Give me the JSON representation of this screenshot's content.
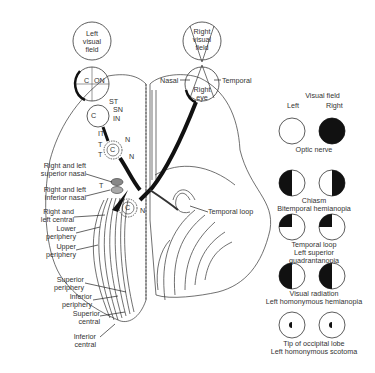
{
  "diagram": {
    "left_visual_field": [
      "Left",
      "visual",
      "field"
    ],
    "right_visual_field": [
      "Right",
      "visual",
      "field"
    ],
    "right_eye": [
      "Right",
      "eye"
    ],
    "nasal": "Nasal",
    "temporal": "Temporal",
    "retina_labels": {
      "c": "C",
      "on": "ON"
    },
    "optic_nerve_labels": {
      "st": "ST",
      "sn": "SN",
      "in": "IN",
      "c": "C",
      "it": "IT"
    },
    "chiasm_labels": {
      "t1": "T",
      "t2": "T",
      "n1": "N",
      "n2": "N",
      "c": "C"
    },
    "lgn_labels": {
      "t": "T",
      "c": "C",
      "n": "N",
      "t2": "T"
    },
    "left_labels": {
      "superior_nasal": [
        "Right and left",
        "superior nasal"
      ],
      "inferior_nasal": [
        "Right and left",
        "inferior nasal"
      ],
      "central": [
        "Right and",
        "left central"
      ],
      "lower_periphery": [
        "Lower",
        "periphery"
      ],
      "upper_periphery": [
        "Upper",
        "periphery"
      ],
      "superior_periphery": [
        "Superior",
        "periphery"
      ],
      "inferior_periphery": [
        "Inferior",
        "periphery"
      ],
      "superior_central": [
        "Superior",
        "central"
      ],
      "inferior_central": [
        "Inferior",
        "central"
      ]
    },
    "temporal_loop": "Temporal loop"
  },
  "legend": {
    "header": "Visual field",
    "left": "Left",
    "right": "Right",
    "rows": [
      {
        "caption": [
          "Optic nerve"
        ],
        "left_defect": "none",
        "right_defect": "full"
      },
      {
        "caption": [
          "Chiasm",
          "Bitemporal hemianopia"
        ],
        "left_defect": "left-half",
        "right_defect": "right-half"
      },
      {
        "caption": [
          "Temporal loop",
          "Left superior",
          "quadrantanopia"
        ],
        "left_defect": "upper-left-quadrant",
        "right_defect": "upper-left-quadrant"
      },
      {
        "caption": [
          "Visual radiation",
          "Left homonymous hemianopia"
        ],
        "left_defect": "left-half",
        "right_defect": "left-half"
      },
      {
        "caption": [
          "Tip of occipital lobe",
          "Left homonymous scotoma"
        ],
        "left_defect": "left-central-spot",
        "right_defect": "left-central-spot"
      }
    ]
  }
}
